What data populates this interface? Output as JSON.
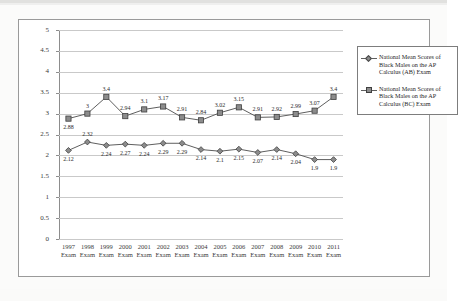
{
  "chart_data": {
    "type": "line",
    "title": "",
    "xlabel": "",
    "ylabel": "",
    "ylim": [
      0,
      5
    ],
    "yticks": [
      "0",
      "0.5",
      "1",
      "1.5",
      "2",
      "2.5",
      "3",
      "3.5",
      "4",
      "4.5",
      "5"
    ],
    "grid": true,
    "legend_position": "right",
    "categories": [
      "1997 Exam",
      "1998 Exam",
      "1999 Exam",
      "2000 Exam",
      "2001 Exam",
      "2002 Exam",
      "2003 Exam",
      "2004 Exam",
      "2005 Exam",
      "2006 Exam",
      "2007 Exam",
      "2008 Exam",
      "2009 Exam",
      "2010 Exam",
      "2011 Exam"
    ],
    "category_years": [
      "1997",
      "1998",
      "1999",
      "2000",
      "2001",
      "2002",
      "2003",
      "2004",
      "2005",
      "2006",
      "2007",
      "2008",
      "2009",
      "2010",
      "2011"
    ],
    "category_suffix": "Exam",
    "series": [
      {
        "name": "National Mean Scores of Black Males on the AP Calculus (AB) Exam",
        "marker": "diamond",
        "values": [
          2.12,
          2.32,
          2.24,
          2.27,
          2.24,
          2.29,
          2.29,
          2.14,
          2.1,
          2.15,
          2.07,
          2.14,
          2.04,
          1.9,
          1.9
        ],
        "labels": [
          "2.12",
          "2.32",
          "2.24",
          "2.27",
          "2.24",
          "2.29",
          "2.29",
          "2.14",
          "2.1",
          "2.15",
          "2.07",
          "2.14",
          "2.04",
          "1.9",
          "1.9"
        ],
        "label_positions": [
          "below",
          "above",
          "below",
          "below",
          "below",
          "below",
          "below",
          "below",
          "below",
          "below",
          "below",
          "below",
          "below",
          "below",
          "below"
        ]
      },
      {
        "name": "National Mean Scores of Black Males on the AP Calculus (BC) Exam",
        "marker": "square",
        "values": [
          2.88,
          3.0,
          3.4,
          2.94,
          3.1,
          3.17,
          2.91,
          2.84,
          3.02,
          3.15,
          2.91,
          2.92,
          2.99,
          3.07,
          3.4
        ],
        "labels": [
          "2.88",
          "3",
          "3.4",
          "2.94",
          "3.1",
          "3.17",
          "2.91",
          "2.84",
          "3.02",
          "3.15",
          "2.91",
          "2.92",
          "2.99",
          "3.07",
          "3.4"
        ],
        "label_positions": [
          "below",
          "above",
          "above",
          "above",
          "above",
          "above",
          "above",
          "above",
          "above",
          "above",
          "above",
          "above",
          "above",
          "above",
          "above"
        ]
      }
    ]
  },
  "legend": {
    "items": [
      {
        "marker": "diamond",
        "line1": "National Mean Scores",
        "line2": "of Black Males on the",
        "line3": "AP Calculus (AB) Exam"
      },
      {
        "marker": "square",
        "line1": "National Mean Scores",
        "line2": "of Black Males on the",
        "line3": "AP Calculus (BC) Exam"
      }
    ]
  },
  "colors": {
    "series_line": "#5f5f5f",
    "marker_fill": "#8c8c8c",
    "marker_stroke": "#3f3f3f",
    "gridline": "#c9c9c9",
    "frame": "#9a9a9a"
  }
}
